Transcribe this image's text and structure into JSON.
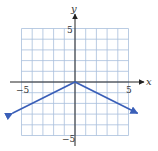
{
  "chart_data": {
    "type": "line",
    "title": "",
    "xlabel": "x",
    "ylabel": "y",
    "xlim": [
      -5,
      5
    ],
    "ylim": [
      -5,
      5
    ],
    "grid": true,
    "x_ticks_labeled": [
      "-5",
      "5"
    ],
    "y_ticks_labeled": [
      "5",
      "-5"
    ],
    "series": [
      {
        "name": "y = -0.5|x|",
        "x": [
          -6,
          -4,
          -2,
          0,
          2,
          4,
          6
        ],
        "y": [
          -3,
          -2,
          -1,
          0,
          -1,
          -2,
          -3
        ],
        "arrows_at_ends": true,
        "color": "#3a5fb8"
      }
    ]
  },
  "labels": {
    "x_axis": "x",
    "y_axis": "y",
    "x_tick_neg": "−5",
    "x_tick_pos": "5",
    "y_tick_pos": "5",
    "y_tick_neg": "−5"
  },
  "colors": {
    "grid": "#a8bfdc",
    "axis": "#333333",
    "line": "#3a5fb8"
  }
}
